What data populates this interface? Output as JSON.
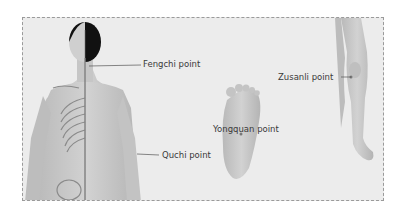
{
  "diagram": {
    "type": "acupressure point illustration",
    "figures": [
      "human-back-with-skeleton",
      "foot-sole",
      "legs-front"
    ],
    "labels": [
      {
        "id": "fengchi",
        "text": "Fengchi point"
      },
      {
        "id": "quchi",
        "text": "Quchi point"
      },
      {
        "id": "yongquan",
        "text": "Yongquan point"
      },
      {
        "id": "zusanli",
        "text": "Zusanli point"
      }
    ],
    "colors": {
      "background": "#ececec",
      "border": "#9a9a9a",
      "skin": "#c9c9c9",
      "hair": "#111111",
      "leader_line": "#555555",
      "text": "#3a3a3a"
    }
  }
}
